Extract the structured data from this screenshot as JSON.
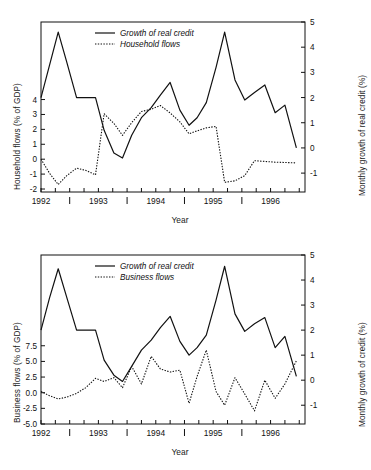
{
  "figure": {
    "background": "#ffffff",
    "line_color": "#111111",
    "panels": [
      "household",
      "business"
    ]
  },
  "chart_data": [
    {
      "id": "household",
      "type": "line",
      "title": "",
      "xlabel": "Year",
      "ylabel": "Household flows (% of GDP)",
      "y2label": "Monthly growth of real credit (%)",
      "grid": false,
      "legend_position": "top-center",
      "xlim": [
        1992.0,
        1996.6
      ],
      "xtick_labels": [
        "1992",
        "1993",
        "1994",
        "1995",
        "1996"
      ],
      "xtick_values": [
        1992,
        1993,
        1994,
        1995,
        1996
      ],
      "xminor_values": [
        1992.5,
        1993.5,
        1994.5,
        1995.5
      ],
      "ylim": [
        -2.2,
        9.2
      ],
      "ytick_labels": [
        "4",
        "3",
        "2",
        "1",
        "0",
        "-1",
        "-2"
      ],
      "ytick_values": [
        4,
        3,
        2,
        1,
        0,
        -1,
        -2
      ],
      "y2lim": [
        -1.75,
        5.0
      ],
      "y2tick_labels": [
        "5",
        "4",
        "3",
        "2",
        "1",
        "0",
        "-1"
      ],
      "y2tick_values": [
        5,
        4,
        3,
        2,
        1,
        0,
        -1
      ],
      "series": [
        {
          "name": "Growth of real credit",
          "style": "solid",
          "axis": "right",
          "x": [
            1992.0,
            1992.15,
            1992.3,
            1992.45,
            1992.62,
            1992.78,
            1992.95,
            1993.1,
            1993.27,
            1993.42,
            1993.58,
            1993.75,
            1993.92,
            1994.08,
            1994.25,
            1994.42,
            1994.58,
            1994.72,
            1994.88,
            1995.05,
            1995.2,
            1995.38,
            1995.55,
            1995.72,
            1995.9,
            1996.08,
            1996.25,
            1996.45
          ],
          "values": [
            2.0,
            3.3,
            4.6,
            3.4,
            2.0,
            2.0,
            2.0,
            0.7,
            -0.2,
            -0.4,
            0.5,
            1.2,
            1.6,
            2.1,
            2.6,
            1.5,
            0.9,
            1.2,
            1.8,
            3.2,
            4.6,
            2.7,
            1.9,
            2.2,
            2.5,
            1.4,
            1.7,
            0.0
          ]
        },
        {
          "name": "Household flows",
          "style": "dotted",
          "axis": "left",
          "x": [
            1992.0,
            1992.15,
            1992.3,
            1992.45,
            1992.62,
            1992.78,
            1992.95,
            1993.1,
            1993.27,
            1993.42,
            1993.58,
            1993.75,
            1993.92,
            1994.08,
            1994.25,
            1994.42,
            1994.58,
            1994.72,
            1994.88,
            1995.05,
            1995.2,
            1995.38,
            1995.55,
            1995.72,
            1995.9,
            1996.08,
            1996.25,
            1996.45
          ],
          "values": [
            0.0,
            -0.95,
            -1.7,
            -1.1,
            -0.6,
            -0.75,
            -1.05,
            3.05,
            2.4,
            1.6,
            2.45,
            3.2,
            3.35,
            3.6,
            3.1,
            2.5,
            1.7,
            1.9,
            2.1,
            2.2,
            -1.55,
            -1.45,
            -1.1,
            -0.1,
            -0.15,
            -0.2,
            -0.22,
            -0.25
          ]
        }
      ]
    },
    {
      "id": "business",
      "type": "line",
      "title": "",
      "xlabel": "Year",
      "ylabel": "Business flows (% of GDP)",
      "y2label": "Monthly growth of credit (%)",
      "grid": false,
      "legend_position": "top-center",
      "xlim": [
        1992.0,
        1996.6
      ],
      "xtick_labels": [
        "1992",
        "1993",
        "1994",
        "1995",
        "1996"
      ],
      "xtick_values": [
        1992,
        1993,
        1994,
        1995,
        1996
      ],
      "xminor_values": [
        1992.5,
        1993.5,
        1994.5,
        1995.5
      ],
      "ylim": [
        -5.0,
        22.0
      ],
      "ytick_labels": [
        "7.5",
        "5.0",
        "2.5",
        "0.0",
        "-2.5",
        "-5.0"
      ],
      "ytick_values": [
        7.5,
        5.0,
        2.5,
        0.0,
        -2.5,
        -5.0
      ],
      "y2lim": [
        -1.75,
        5.0
      ],
      "y2tick_labels": [
        "5",
        "4",
        "3",
        "2",
        "1",
        "0",
        "-1"
      ],
      "y2tick_values": [
        5,
        4,
        3,
        2,
        1,
        0,
        -1
      ],
      "series": [
        {
          "name": "Growth of real credit",
          "style": "solid",
          "axis": "right",
          "x": [
            1992.0,
            1992.15,
            1992.3,
            1992.45,
            1992.62,
            1992.78,
            1992.95,
            1993.1,
            1993.27,
            1993.42,
            1993.58,
            1993.75,
            1993.92,
            1994.08,
            1994.25,
            1994.42,
            1994.58,
            1994.72,
            1994.88,
            1995.05,
            1995.2,
            1995.38,
            1995.55,
            1995.72,
            1995.9,
            1996.08,
            1996.25,
            1996.45
          ],
          "values": [
            2.0,
            3.3,
            4.45,
            3.3,
            2.0,
            2.0,
            2.0,
            0.8,
            0.2,
            -0.05,
            0.55,
            1.2,
            1.6,
            2.1,
            2.55,
            1.55,
            1.0,
            1.3,
            1.8,
            3.2,
            4.55,
            2.65,
            1.95,
            2.25,
            2.5,
            1.3,
            1.75,
            0.15
          ]
        },
        {
          "name": "Business flows",
          "style": "dotted",
          "axis": "left",
          "x": [
            1992.0,
            1992.15,
            1992.3,
            1992.45,
            1992.62,
            1992.78,
            1992.95,
            1993.1,
            1993.27,
            1993.42,
            1993.58,
            1993.75,
            1993.92,
            1994.08,
            1994.25,
            1994.42,
            1994.58,
            1994.72,
            1994.88,
            1995.05,
            1995.2,
            1995.38,
            1995.55,
            1995.72,
            1995.9,
            1996.08,
            1996.25,
            1996.45
          ],
          "values": [
            0.2,
            -0.5,
            -1.0,
            -0.7,
            -0.1,
            0.8,
            2.3,
            1.8,
            2.4,
            0.8,
            4.2,
            1.4,
            5.8,
            3.8,
            3.3,
            3.6,
            -1.7,
            2.6,
            6.8,
            0.2,
            -2.0,
            2.4,
            -0.2,
            -2.9,
            2.0,
            -0.9,
            1.4,
            5.1
          ]
        }
      ]
    }
  ],
  "legends": {
    "household": [
      {
        "label": "Growth of real credit",
        "style": "solid"
      },
      {
        "label": "Household flows",
        "style": "dotted"
      }
    ],
    "business": [
      {
        "label": "Growth of real credit",
        "style": "solid"
      },
      {
        "label": "Business flows",
        "style": "dotted"
      }
    ]
  }
}
